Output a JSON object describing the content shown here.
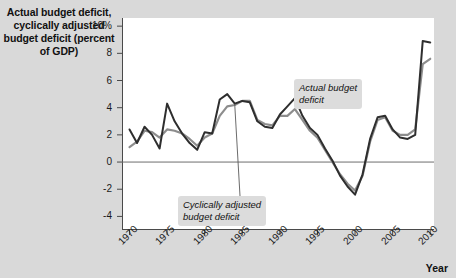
{
  "chart_data": {
    "type": "line",
    "title": "Actual budget deficit,\ncyclically adjusted\nbudget deficit\n(percent of GDP)",
    "xlabel": "Year",
    "ylabel": "",
    "xlim": [
      1969,
      2010.5
    ],
    "ylim": [
      -5,
      10.6
    ],
    "grid": false,
    "legend_position": "inline-annotations",
    "yticks": [
      {
        "value": 10,
        "label": "10%"
      },
      {
        "value": 8,
        "label": "8"
      },
      {
        "value": 6,
        "label": "6"
      },
      {
        "value": 4,
        "label": "4"
      },
      {
        "value": 2,
        "label": "2"
      },
      {
        "value": 0,
        "label": "0"
      },
      {
        "value": -2,
        "label": "-2"
      },
      {
        "value": -4,
        "label": "-4"
      }
    ],
    "xticks": [
      {
        "value": 1970,
        "label": "1970"
      },
      {
        "value": 1975,
        "label": "1975"
      },
      {
        "value": 1980,
        "label": "1980"
      },
      {
        "value": 1985,
        "label": "1985"
      },
      {
        "value": 1990,
        "label": "1990"
      },
      {
        "value": 1995,
        "label": "1995"
      },
      {
        "value": 2000,
        "label": "2000"
      },
      {
        "value": 2005,
        "label": "2005"
      },
      {
        "value": 2010,
        "label": "2010"
      }
    ],
    "zero_line": 0,
    "x": [
      1970,
      1971,
      1972,
      1973,
      1974,
      1975,
      1976,
      1977,
      1978,
      1979,
      1980,
      1981,
      1982,
      1983,
      1984,
      1985,
      1986,
      1987,
      1988,
      1989,
      1990,
      1991,
      1992,
      1993,
      1994,
      1995,
      1996,
      1997,
      1998,
      1999,
      2000,
      2001,
      2002,
      2003,
      2004,
      2005,
      2006,
      2007,
      2008,
      2009,
      2010
    ],
    "series": [
      {
        "name": "Actual budget deficit",
        "color": "#2e2e2e",
        "values": [
          2.4,
          1.4,
          2.6,
          2.0,
          1.0,
          4.3,
          3.0,
          2.1,
          1.4,
          0.9,
          2.2,
          2.1,
          4.6,
          5.0,
          4.3,
          4.5,
          4.4,
          3.0,
          2.6,
          2.5,
          3.5,
          4.1,
          4.7,
          3.4,
          2.5,
          2.0,
          1.0,
          0.1,
          -1.0,
          -1.8,
          -2.4,
          -0.9,
          1.7,
          3.3,
          3.4,
          2.4,
          1.8,
          1.7,
          2.0,
          8.9,
          8.8
        ]
      },
      {
        "name": "Cyclically adjusted budget deficit",
        "color": "#8d8d8d",
        "values": [
          1.1,
          1.5,
          2.3,
          2.2,
          1.8,
          2.4,
          2.3,
          2.1,
          1.7,
          1.2,
          1.8,
          2.1,
          3.4,
          4.1,
          4.2,
          4.5,
          4.5,
          3.1,
          2.8,
          2.7,
          3.4,
          3.4,
          3.9,
          3.1,
          2.3,
          1.8,
          0.9,
          0.0,
          -0.9,
          -1.6,
          -2.1,
          -1.0,
          1.5,
          3.1,
          3.3,
          2.3,
          2.0,
          2.0,
          2.4,
          7.2,
          7.6
        ]
      }
    ],
    "annotations": [
      {
        "text": "Actual budget\ndeficit",
        "target_series": "Actual budget deficit",
        "target_x": 1992
      },
      {
        "text": "Cyclically adjusted\nbudget deficit",
        "target_series": "Cyclically adjusted budget deficit",
        "target_x": 1984
      }
    ]
  }
}
